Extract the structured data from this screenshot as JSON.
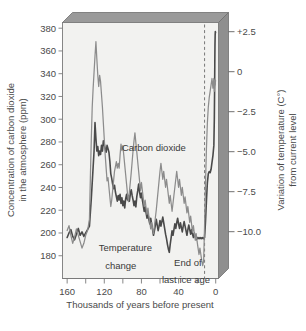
{
  "chart_data": {
    "type": "line",
    "title": "",
    "xlabel": "Thousands of years before present",
    "ylabel": "Concentration of carbon dioxide in the atmosphere (ppm)",
    "ylabel_line1": "Concentration of carbon dioxide",
    "ylabel_line2": "in the atmosphere (ppm)",
    "y2label_line1": "Variation of temperature (C°)",
    "y2label_line2": "from current level",
    "xlim": [
      165,
      -3
    ],
    "ylim": [
      160,
      385
    ],
    "y2lim": [
      -12.3,
      3.7
    ],
    "grid": false,
    "legend": "inline-annotations",
    "xticks": [
      160,
      120,
      80,
      40,
      0
    ],
    "xticks_minor": [
      140,
      100,
      60,
      20
    ],
    "yticks": [
      180,
      200,
      220,
      240,
      260,
      280,
      300,
      320,
      340,
      360,
      380
    ],
    "y2ticks": [
      "+2.5",
      "0",
      "−2.5",
      "−5.0",
      "−7.5",
      "−10.0"
    ],
    "y2tickvals": [
      2.5,
      0,
      -2.5,
      -5.0,
      -7.5,
      -10.0
    ],
    "annotations": [
      {
        "name": "carbon-dioxide-label",
        "text": "Carbon dioxide",
        "x": 101,
        "y": 272
      },
      {
        "name": "temperature-change-label",
        "text": "Temperature",
        "x": 126,
        "y": 178
      },
      {
        "name": "temperature-change-label-2",
        "text": "change",
        "x": 119,
        "y": 172
      },
      {
        "name": "end-of-ice-age-label",
        "text": "End of",
        "x": 30,
        "y": 175
      },
      {
        "name": "end-of-ice-age-label-2",
        "text": "last ice age",
        "x": 32,
        "y": 169
      }
    ],
    "marker_line": {
      "name": "end-of-last-ice-age-marker",
      "x": 12,
      "style": "dashed"
    },
    "colors": {
      "co2_line": "#4a4a4a",
      "temp_line": "#8c8c8c",
      "plot_face": "#f2f2f0",
      "box_top": "#9a9a9a",
      "box_right": "#8f8f8f",
      "axis": "#7a7a7a"
    },
    "series": [
      {
        "name": "Carbon dioxide",
        "unit": "ppm",
        "axis": "left",
        "points": [
          [
            160,
            196
          ],
          [
            158,
            200
          ],
          [
            156,
            203
          ],
          [
            154,
            197
          ],
          [
            152,
            194
          ],
          [
            150,
            199
          ],
          [
            148,
            204
          ],
          [
            146,
            198
          ],
          [
            144,
            201
          ],
          [
            142,
            197
          ],
          [
            140,
            200
          ],
          [
            138,
            203
          ],
          [
            136,
            206
          ],
          [
            134,
            230
          ],
          [
            132,
            258
          ],
          [
            131,
            272
          ],
          [
            130,
            297
          ],
          [
            129,
            283
          ],
          [
            128,
            272
          ],
          [
            127,
            276
          ],
          [
            126,
            268
          ],
          [
            125,
            272
          ],
          [
            124,
            269
          ],
          [
            123,
            277
          ],
          [
            122,
            272
          ],
          [
            121,
            281
          ],
          [
            120,
            278
          ],
          [
            119,
            274
          ],
          [
            118,
            271
          ],
          [
            117,
            277
          ],
          [
            116,
            274
          ],
          [
            115,
            271
          ],
          [
            114,
            263
          ],
          [
            113,
            252
          ],
          [
            112,
            248
          ],
          [
            111,
            243
          ],
          [
            110,
            239
          ],
          [
            109,
            242
          ],
          [
            108,
            236
          ],
          [
            107,
            232
          ],
          [
            106,
            228
          ],
          [
            105,
            233
          ],
          [
            104,
            229
          ],
          [
            103,
            234
          ],
          [
            102,
            226
          ],
          [
            101,
            231
          ],
          [
            100,
            224
          ],
          [
            99,
            228
          ],
          [
            98,
            222
          ],
          [
            97,
            230
          ],
          [
            96,
            234
          ],
          [
            95,
            229
          ],
          [
            94,
            233
          ],
          [
            93,
            228
          ],
          [
            92,
            234
          ],
          [
            91,
            238
          ],
          [
            90,
            233
          ],
          [
            89,
            229
          ],
          [
            88,
            224
          ],
          [
            87,
            228
          ],
          [
            86,
            223
          ],
          [
            85,
            232
          ],
          [
            84,
            237
          ],
          [
            83,
            243
          ],
          [
            82,
            236
          ],
          [
            81,
            231
          ],
          [
            80,
            235
          ],
          [
            79,
            229
          ],
          [
            78,
            224
          ],
          [
            77,
            219
          ],
          [
            76,
            223
          ],
          [
            75,
            218
          ],
          [
            74,
            213
          ],
          [
            73,
            217
          ],
          [
            72,
            212
          ],
          [
            71,
            208
          ],
          [
            70,
            213
          ],
          [
            69,
            208
          ],
          [
            68,
            203
          ],
          [
            67,
            198
          ],
          [
            66,
            202
          ],
          [
            65,
            207
          ],
          [
            64,
            212
          ],
          [
            63,
            207
          ],
          [
            62,
            202
          ],
          [
            61,
            206
          ],
          [
            60,
            211
          ],
          [
            59,
            206
          ],
          [
            58,
            210
          ],
          [
            57,
            214
          ],
          [
            56,
            209
          ],
          [
            55,
            204
          ],
          [
            54,
            199
          ],
          [
            53,
            195
          ],
          [
            52,
            190
          ],
          [
            51,
            186
          ],
          [
            50,
            183
          ],
          [
            49,
            190
          ],
          [
            48,
            196
          ],
          [
            47,
            202
          ],
          [
            46,
            198
          ],
          [
            45,
            203
          ],
          [
            44,
            208
          ],
          [
            43,
            204
          ],
          [
            42,
            209
          ],
          [
            41,
            213
          ],
          [
            40,
            208
          ],
          [
            39,
            204
          ],
          [
            38,
            209
          ],
          [
            37,
            205
          ],
          [
            36,
            201
          ],
          [
            35,
            206
          ],
          [
            34,
            210
          ],
          [
            33,
            206
          ],
          [
            32,
            202
          ],
          [
            31,
            198
          ],
          [
            30,
            203
          ],
          [
            29,
            207
          ],
          [
            28,
            203
          ],
          [
            27,
            199
          ],
          [
            26,
            203
          ],
          [
            25,
            199
          ],
          [
            24,
            196
          ],
          [
            23,
            200
          ],
          [
            22,
            197
          ],
          [
            21,
            194
          ],
          [
            20,
            196
          ],
          [
            19,
            195
          ],
          [
            18,
            196
          ],
          [
            17,
            195
          ],
          [
            16,
            196
          ],
          [
            15,
            195
          ],
          [
            14,
            196
          ],
          [
            13,
            195
          ],
          [
            12,
            196
          ],
          [
            11,
            210
          ],
          [
            10,
            228
          ],
          [
            9,
            244
          ],
          [
            8,
            252
          ],
          [
            7,
            254
          ],
          [
            6,
            253
          ],
          [
            5,
            256
          ],
          [
            4,
            262
          ],
          [
            3,
            268
          ],
          [
            2,
            277
          ],
          [
            1.5,
            300
          ],
          [
            1.2,
            325
          ],
          [
            1.0,
            348
          ],
          [
            0.8,
            365
          ],
          [
            0.6,
            374
          ],
          [
            0.4,
            377
          ],
          [
            0.2,
            376
          ]
        ]
      },
      {
        "name": "Temperature change",
        "unit": "C°",
        "axis": "right",
        "points": [
          [
            160,
            -9.3
          ],
          [
            158,
            -9.0
          ],
          [
            156,
            -9.6
          ],
          [
            154,
            -10.1
          ],
          [
            152,
            -9.7
          ],
          [
            150,
            -9.2
          ],
          [
            148,
            -9.6
          ],
          [
            146,
            -10.0
          ],
          [
            144,
            -10.4
          ],
          [
            142,
            -10.1
          ],
          [
            140,
            -9.6
          ],
          [
            138,
            -9.3
          ],
          [
            136,
            -8.6
          ],
          [
            135,
            -6.0
          ],
          [
            134,
            -3.6
          ],
          [
            133,
            -1.6
          ],
          [
            132,
            -0.4
          ],
          [
            131,
            0.6
          ],
          [
            130,
            1.6
          ],
          [
            129,
            2.5
          ],
          [
            128,
            1.4
          ],
          [
            127,
            0.4
          ],
          [
            126,
            -0.3
          ],
          [
            125,
            0.4
          ],
          [
            124,
            0.0
          ],
          [
            123,
            -0.8
          ],
          [
            122,
            -1.6
          ],
          [
            121,
            -2.6
          ],
          [
            120,
            -3.6
          ],
          [
            119,
            -4.6
          ],
          [
            118,
            -5.4
          ],
          [
            117,
            -6.2
          ],
          [
            116,
            -6.0
          ],
          [
            115,
            -6.6
          ],
          [
            114,
            -7.2
          ],
          [
            113,
            -7.8
          ],
          [
            112,
            -7.4
          ],
          [
            111,
            -6.8
          ],
          [
            110,
            -6.2
          ],
          [
            109,
            -5.6
          ],
          [
            108,
            -5.3
          ],
          [
            107,
            -5.0
          ],
          [
            106,
            -5.4
          ],
          [
            105,
            -5.1
          ],
          [
            104,
            -5.4
          ],
          [
            103,
            -4.6
          ],
          [
            102,
            -3.9
          ],
          [
            101,
            -4.3
          ],
          [
            100,
            -4.0
          ],
          [
            99,
            -4.6
          ],
          [
            98,
            -5.2
          ],
          [
            97,
            -5.8
          ],
          [
            96,
            -6.4
          ],
          [
            95,
            -7.0
          ],
          [
            94,
            -7.5
          ],
          [
            93,
            -6.9
          ],
          [
            92,
            -6.3
          ],
          [
            91,
            -5.7
          ],
          [
            90,
            -5.0
          ],
          [
            89,
            -4.3
          ],
          [
            88,
            -3.7
          ],
          [
            87,
            -3.2
          ],
          [
            86,
            -3.8
          ],
          [
            85,
            -4.4
          ],
          [
            84,
            -5.0
          ],
          [
            83,
            -5.6
          ],
          [
            82,
            -6.2
          ],
          [
            81,
            -6.8
          ],
          [
            80,
            -6.3
          ],
          [
            79,
            -6.8
          ],
          [
            78,
            -7.3
          ],
          [
            77,
            -7.8
          ],
          [
            76,
            -7.4
          ],
          [
            75,
            -7.9
          ],
          [
            74,
            -8.3
          ],
          [
            73,
            -7.9
          ],
          [
            72,
            -8.4
          ],
          [
            71,
            -8.8
          ],
          [
            70,
            -9.2
          ],
          [
            69,
            -8.8
          ],
          [
            68,
            -9.2
          ],
          [
            67,
            -9.5
          ],
          [
            66,
            -9.0
          ],
          [
            65,
            -8.5
          ],
          [
            64,
            -8.0
          ],
          [
            63,
            -7.4
          ],
          [
            62,
            -6.8
          ],
          [
            61,
            -6.2
          ],
          [
            60,
            -5.6
          ],
          [
            59,
            -5.1
          ],
          [
            58,
            -5.6
          ],
          [
            57,
            -6.1
          ],
          [
            56,
            -5.6
          ],
          [
            55,
            -6.1
          ],
          [
            54,
            -6.6
          ],
          [
            53,
            -6.1
          ],
          [
            52,
            -6.6
          ],
          [
            51,
            -7.1
          ],
          [
            50,
            -7.6
          ],
          [
            49,
            -7.1
          ],
          [
            48,
            -7.6
          ],
          [
            47,
            -8.1
          ],
          [
            46,
            -7.6
          ],
          [
            45,
            -7.1
          ],
          [
            44,
            -6.6
          ],
          [
            43,
            -6.1
          ],
          [
            42,
            -5.6
          ],
          [
            41,
            -6.1
          ],
          [
            40,
            -6.6
          ],
          [
            39,
            -6.1
          ],
          [
            38,
            -6.6
          ],
          [
            37,
            -7.1
          ],
          [
            36,
            -6.6
          ],
          [
            35,
            -7.1
          ],
          [
            34,
            -7.6
          ],
          [
            33,
            -7.2
          ],
          [
            32,
            -7.7
          ],
          [
            31,
            -8.2
          ],
          [
            30,
            -7.8
          ],
          [
            29,
            -8.3
          ],
          [
            28,
            -8.8
          ],
          [
            27,
            -8.4
          ],
          [
            26,
            -8.9
          ],
          [
            25,
            -9.4
          ],
          [
            24,
            -9.0
          ],
          [
            23,
            -9.5
          ],
          [
            22,
            -9.9
          ],
          [
            21,
            -9.5
          ],
          [
            20,
            -10.0
          ],
          [
            19,
            -10.4
          ],
          [
            18,
            -10.8
          ],
          [
            17,
            -10.4
          ],
          [
            16,
            -10.8
          ],
          [
            15,
            -11.2
          ],
          [
            14,
            -11.5
          ],
          [
            13,
            -11.2
          ],
          [
            12,
            -9.0
          ],
          [
            11,
            -6.4
          ],
          [
            10,
            -4.2
          ],
          [
            9,
            -2.6
          ],
          [
            8,
            -1.6
          ],
          [
            7,
            -1.0
          ],
          [
            6,
            -0.6
          ],
          [
            5,
            -0.2
          ],
          [
            4,
            0.2
          ],
          [
            3,
            -0.4
          ],
          [
            2,
            0.2
          ],
          [
            1.5,
            -0.6
          ],
          [
            1.0,
            0.1
          ],
          [
            0.5,
            -0.2
          ],
          [
            0.2,
            0.1
          ]
        ]
      }
    ]
  }
}
